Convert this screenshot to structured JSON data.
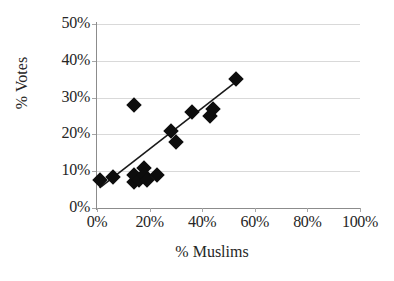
{
  "chart_data": {
    "type": "scatter",
    "title": "",
    "xlabel": "% Muslims",
    "ylabel": "% Votes",
    "xlim": [
      0,
      100
    ],
    "ylim": [
      0,
      50
    ],
    "xticks": [
      "0%",
      "20%",
      "40%",
      "60%",
      "80%",
      "100%"
    ],
    "xtick_values": [
      0,
      20,
      40,
      60,
      80,
      100
    ],
    "yticks": [
      "0%",
      "10%",
      "20%",
      "30%",
      "40%",
      "50%"
    ],
    "ytick_values": [
      0,
      10,
      20,
      30,
      40,
      50
    ],
    "grid": true,
    "legend": null,
    "marker_shape": "diamond",
    "marker_color": "#0d0d0d",
    "trendline": {
      "visible": true,
      "color": "#1a1a1a",
      "x_start": 1,
      "y_start": 5.5,
      "x_end": 55,
      "y_end": 35.5
    },
    "points": [
      {
        "x": 1,
        "y": 7.5
      },
      {
        "x": 6,
        "y": 8.5
      },
      {
        "x": 14,
        "y": 28.0
      },
      {
        "x": 14,
        "y": 7.0
      },
      {
        "x": 14,
        "y": 9.0
      },
      {
        "x": 16,
        "y": 7.5
      },
      {
        "x": 18,
        "y": 11.0
      },
      {
        "x": 18,
        "y": 9.0
      },
      {
        "x": 19,
        "y": 7.5
      },
      {
        "x": 23,
        "y": 9.0
      },
      {
        "x": 28,
        "y": 21.0
      },
      {
        "x": 30,
        "y": 18.0
      },
      {
        "x": 36,
        "y": 26.0
      },
      {
        "x": 43,
        "y": 25.0
      },
      {
        "x": 44,
        "y": 27.0
      },
      {
        "x": 53,
        "y": 35.0
      }
    ]
  }
}
